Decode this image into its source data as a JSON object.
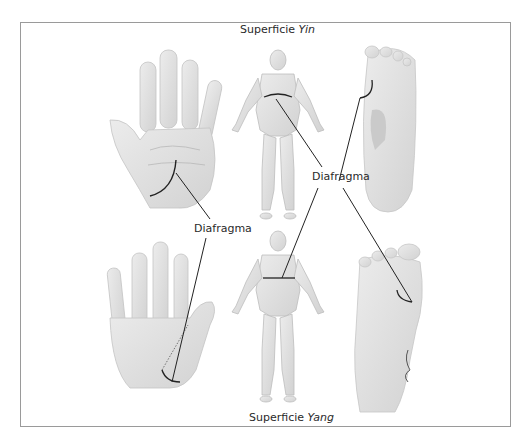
{
  "figure": {
    "top_caption": {
      "prefix": "Superficie",
      "emphasis": "Yin"
    },
    "bottom_caption": {
      "prefix": "Superficie",
      "emphasis": "Yang"
    },
    "callouts": [
      {
        "id": "upper",
        "text": "Diafragma"
      },
      {
        "id": "lower",
        "text": "Diafragma"
      }
    ],
    "panels": [
      {
        "id": "palm",
        "description": "palm of right hand (yin surface)"
      },
      {
        "id": "body-front",
        "description": "human body front view"
      },
      {
        "id": "sole",
        "description": "sole of foot (yin surface)"
      },
      {
        "id": "hand-back",
        "description": "back of hand (yang surface)"
      },
      {
        "id": "body-back",
        "description": "human body back view"
      },
      {
        "id": "foot-top",
        "description": "top of foot (yang surface)"
      }
    ],
    "colors": {
      "frame": "#9a9a9a",
      "skin": "#dedede",
      "skin_shade": "#cfcfcf",
      "line": "#222222"
    }
  }
}
